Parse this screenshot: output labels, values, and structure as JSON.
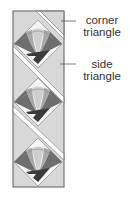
{
  "diagram": {
    "type": "quilt-layout-diagram",
    "blocks_count": 3,
    "labels": [
      {
        "id": "corner",
        "line1": "corner",
        "line2": "triangle"
      },
      {
        "id": "side",
        "line1": "side",
        "line2": "triangle"
      }
    ],
    "colors": {
      "background": "#ffffff",
      "setting_triangle": "#d8d8d8",
      "outline": "#7a7a7a",
      "fan_light": "#cfcfcf",
      "fan_mid": "#a8a8a8",
      "fan_dark": "#6e6e6e",
      "fan_darkest": "#3a3a3a",
      "center_white": "#f4f4f4",
      "sashing": "#ffffff",
      "leader_line": "#555555",
      "text": "#333333"
    }
  }
}
